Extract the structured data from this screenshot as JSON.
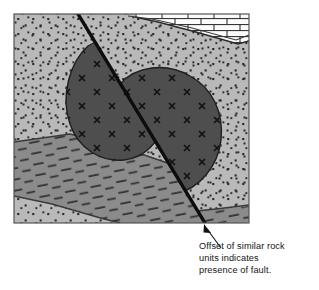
{
  "figure": {
    "type": "geologic-block-diagram",
    "frame": {
      "x": 14,
      "y": 14,
      "width": 235,
      "height": 209,
      "border_color": "#555555",
      "background_color": "#b9b9b9"
    }
  },
  "caption": {
    "lines": [
      "Offset of similar rock",
      "units indicates",
      "presence of fault."
    ],
    "full_text": "Offset of similar rock units indicates presence of fault.",
    "color": "#141414"
  },
  "leader": {
    "label": "leader-arrow",
    "from_x": 221,
    "from_y": 248,
    "to_x": 205,
    "to_y": 226,
    "color": "#111111"
  },
  "units": [
    {
      "id": "sandstone",
      "name": "Dotted sandstone unit",
      "pattern": "dots",
      "fill": "#b9b9b9",
      "dot_color": "#2a2a2a"
    },
    {
      "id": "igneous-body",
      "name": "Dark intrusive body with crystal marks",
      "pattern": "x-marks",
      "fill": "#4e4e4e",
      "mark_color": "#111111",
      "outline": "#1e1e1e"
    },
    {
      "id": "shale",
      "name": "Dashed shale-schist unit",
      "pattern": "dashes",
      "fill": "#8b8b8b",
      "dash_color": "#2f2f2f",
      "outline": "#3a3a3a"
    },
    {
      "id": "limestone",
      "name": "Brick-patterned limestone layer",
      "pattern": "bricks",
      "fill": "#fbfbfb",
      "line_color": "#222222"
    }
  ],
  "fault": {
    "name": "fault-trace",
    "color": "#0d0d0d",
    "stroke_width": 3.4,
    "top_x": 78,
    "top_y": 14,
    "bottom_x": 205,
    "bottom_y": 223
  },
  "colors": {
    "page_background": "#ffffff",
    "light_gray": "#b9b9b9",
    "mid_gray": "#8b8b8b",
    "dark_gray": "#4e4e4e",
    "white": "#fbfbfb",
    "ink": "#141414"
  }
}
